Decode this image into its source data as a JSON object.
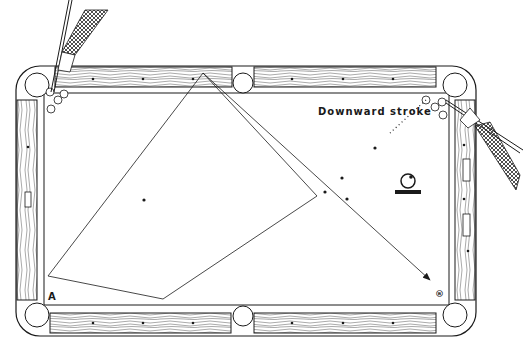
{
  "diagram": {
    "caption": "Downward stroke",
    "point_a_label": "A",
    "point_b_label": "®",
    "colors": {
      "ink": "#1a1a1a",
      "paper": "#ffffff"
    },
    "table": {
      "pockets": [
        "top-left",
        "top-middle",
        "top-right",
        "bottom-left",
        "bottom-middle",
        "bottom-right"
      ],
      "diamonds_per_long_rail_half": 3,
      "diamonds_per_short_rail": 3
    },
    "shot_path_1": {
      "description": "cue ball path from top-left corner around table",
      "points": [
        [
          48,
          276
        ],
        [
          203,
          73
        ],
        [
          317,
          196
        ]
      ]
    },
    "shot_path_2": {
      "description": "polygon kick shot",
      "points": [
        [
          48,
          276
        ],
        [
          163,
          299
        ],
        [
          317,
          196
        ]
      ]
    },
    "shot_path_3": {
      "description": "arrow to pocket B",
      "from": [
        203,
        73
      ],
      "to": [
        430,
        280
      ]
    },
    "object_balls_top_left": 4,
    "object_balls_top_right": 3,
    "spots_on_table": 5,
    "icons": [
      "cue-ball-spin-icon",
      "hand-with-cue-icon"
    ]
  }
}
